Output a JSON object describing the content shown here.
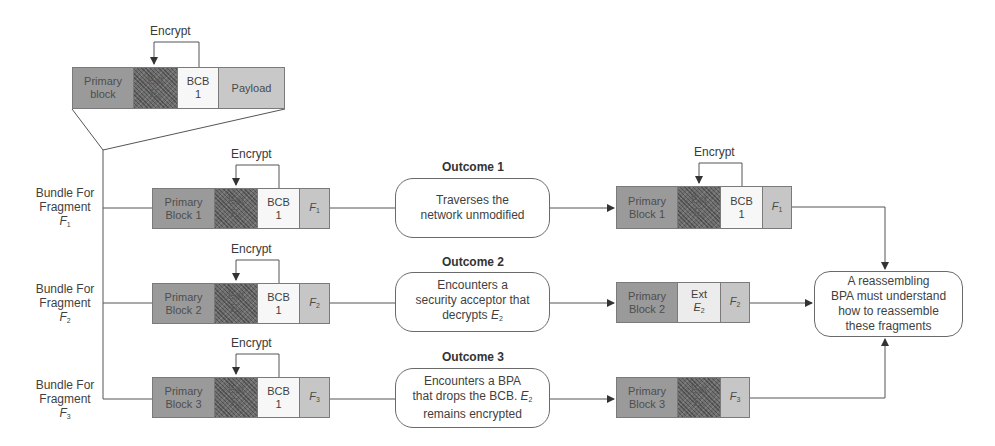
{
  "diagram": {
    "source_bundle": {
      "encrypt_label": "Encrypt",
      "blocks": [
        {
          "label": "Primary",
          "label2": "block",
          "type": "primary"
        },
        {
          "label": "Ext",
          "label2": "E",
          "sub": "2",
          "type": "ext-encrypted"
        },
        {
          "label": "BCB",
          "label2": "1",
          "type": "bcb"
        },
        {
          "label": "Payload",
          "type": "payload"
        }
      ]
    },
    "fragments": [
      {
        "side_label": [
          "Bundle For",
          "Fragment",
          "F"
        ],
        "sub": "1",
        "encrypt_label": "Encrypt",
        "blocks": {
          "primary": [
            "Primary",
            "Block 1"
          ],
          "ext": [
            "Ext",
            "E",
            "2"
          ],
          "bcb": [
            "BCB",
            "1"
          ],
          "frag": [
            "F",
            "1"
          ]
        },
        "outcome": {
          "title": "Outcome 1",
          "text": [
            "Traverses the",
            "network unmodified"
          ]
        },
        "result": {
          "encrypt_label": "Encrypt",
          "primary": [
            "Primary",
            "Block 1"
          ],
          "ext": [
            "Ext",
            "E",
            "2"
          ],
          "ext_state": "encrypted",
          "bcb": [
            "BCB",
            "1"
          ],
          "frag": [
            "F",
            "1"
          ]
        }
      },
      {
        "side_label": [
          "Bundle For",
          "Fragment",
          "F"
        ],
        "sub": "2",
        "encrypt_label": "Encrypt",
        "blocks": {
          "primary": [
            "Primary",
            "Block 2"
          ],
          "ext": [
            "Ext",
            "E",
            "2"
          ],
          "bcb": [
            "BCB",
            "1"
          ],
          "frag": [
            "F",
            "2"
          ]
        },
        "outcome": {
          "title": "Outcome 2",
          "text": [
            "Encounters a",
            "security acceptor that",
            "decrypts ",
            "E",
            "2"
          ]
        },
        "result": {
          "primary": [
            "Primary",
            "Block 2"
          ],
          "ext": [
            "Ext",
            "E",
            "2"
          ],
          "ext_state": "decrypted",
          "frag": [
            "F",
            "2"
          ]
        }
      },
      {
        "side_label": [
          "Bundle For",
          "Fragment",
          "F"
        ],
        "sub": "3",
        "encrypt_label": "Encrypt",
        "blocks": {
          "primary": [
            "Primary",
            "Block 3"
          ],
          "ext": [
            "Ext",
            "E",
            "2"
          ],
          "bcb": [
            "BCB",
            "1"
          ],
          "frag": [
            "F",
            "3"
          ]
        },
        "outcome": {
          "title": "Outcome 3",
          "text": [
            "Encounters a BPA",
            "that drops the BCB. ",
            "E",
            "2",
            "remains encrypted"
          ]
        },
        "result": {
          "primary": [
            "Primary",
            "Block 3"
          ],
          "ext": [
            "Ext",
            "E",
            "2"
          ],
          "ext_state": "encrypted",
          "frag": [
            "F",
            "3"
          ]
        }
      }
    ],
    "reassembly": {
      "text": [
        "A reassembling",
        "BPA must understand",
        "how to reassemble",
        "these fragments"
      ]
    },
    "colors": {
      "primary_block": "#9a9a9a",
      "ext_encrypted": "#6e6e6e",
      "ext_plain": "#ececec",
      "bcb": "#f7f7f7",
      "payload_fragment": "#c6c6c6",
      "line": "#555555"
    }
  }
}
